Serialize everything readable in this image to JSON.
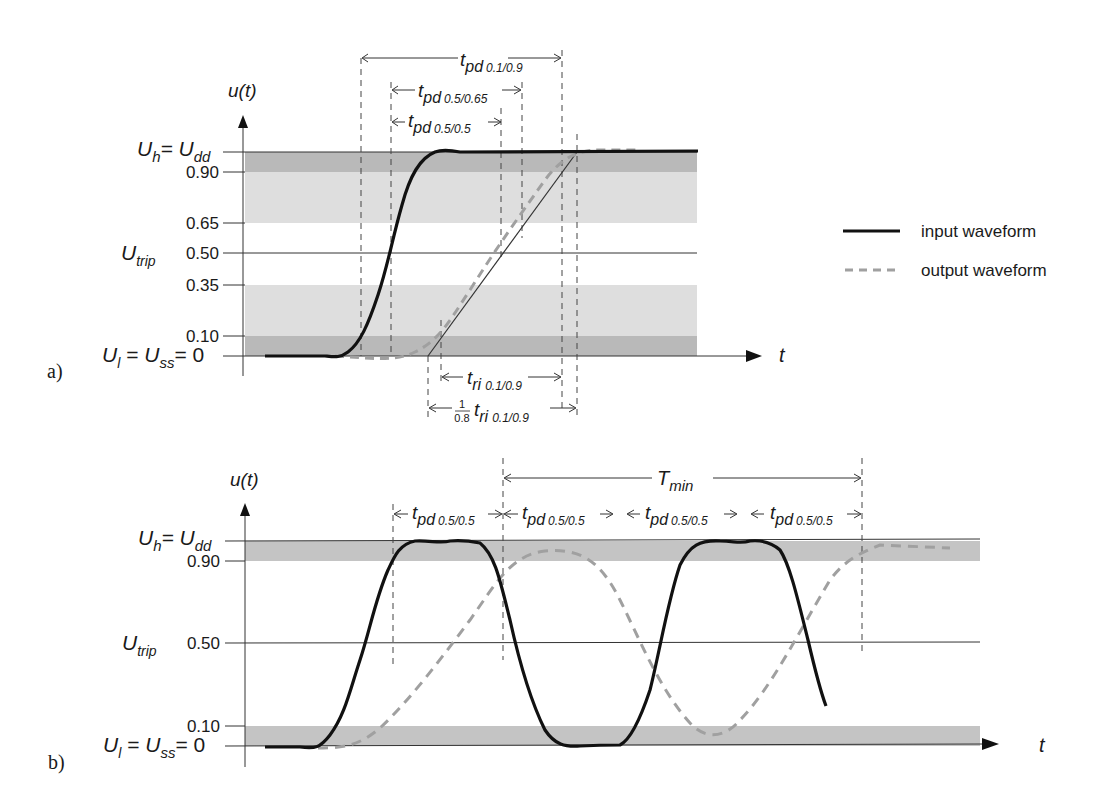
{
  "figure": {
    "panel_a": {
      "tag": "a)",
      "y_axis_label": "u(t)",
      "x_axis_label": "t",
      "y_ticks": [
        {
          "main": "U",
          "sub": "h",
          "eq": "= U",
          "sub2": "dd",
          "level": 1.0
        },
        {
          "label": "0.90",
          "level": 0.9
        },
        {
          "label": "0.65",
          "level": 0.65
        },
        {
          "label": "0.50",
          "level": 0.5
        },
        {
          "label": "0.35",
          "level": 0.35
        },
        {
          "label": "0.10",
          "level": 0.1
        },
        {
          "label": "U_l = U_ss = 0",
          "level": 0
        }
      ],
      "u_low": {
        "U": "U",
        "l": "l",
        "eq1": " = ",
        "U2": "U",
        "ss": "ss",
        "eq2": "= 0"
      },
      "u_trip": {
        "U": "U",
        "sub": "trip"
      },
      "annotations": {
        "tpd_01_09": {
          "t": "t",
          "sub": "pd",
          "range": "0.1/0.9"
        },
        "tpd_05_065": {
          "t": "t",
          "sub": "pd",
          "range": "0.5/0.65"
        },
        "tpd_05_05": {
          "t": "t",
          "sub": "pd",
          "range": "0.5/0.5"
        },
        "tri": {
          "t": "t",
          "sub": "ri",
          "range": "0.1/0.9"
        },
        "tri_scaled": {
          "num": "1",
          "den": "0.8",
          "t": "t",
          "sub": "ri",
          "range": "0.1/0.9"
        }
      }
    },
    "panel_b": {
      "tag": "b)",
      "y_axis_label": "u(t)",
      "x_axis_label": "t",
      "y_ticks": [
        {
          "label": "U_h = U_dd",
          "level": 1.0
        },
        {
          "label": "0.90",
          "level": 0.9
        },
        {
          "label": "0.50",
          "level": 0.5
        },
        {
          "label": "0.10",
          "level": 0.1
        },
        {
          "label": "U_l = U_ss = 0",
          "level": 0
        }
      ],
      "annotations": {
        "tmin": {
          "T": "T",
          "sub": "min"
        },
        "tpd": {
          "t": "t",
          "sub": "pd",
          "range": "0.5/0.5"
        }
      }
    },
    "legend": {
      "items": [
        {
          "label": "input waveform",
          "style": "solid",
          "color": "#111111"
        },
        {
          "label": "output waveform",
          "style": "dashed",
          "color": "#a0a0a0"
        }
      ]
    },
    "labels": {
      "t0_90": "0.90",
      "t0_65": "0.65",
      "t0_50": "0.50",
      "t0_35": "0.35",
      "t0_10": "0.10"
    },
    "colors": {
      "band_dark": "#b9b9b9",
      "band_light": "#dedede",
      "input": "#111111",
      "output": "#a0a0a0"
    }
  }
}
